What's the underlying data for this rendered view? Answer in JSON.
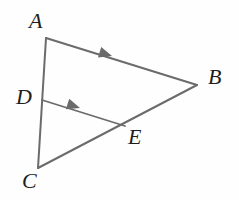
{
  "figure": {
    "background_color": "#fefefe",
    "stroke_color": "#6b6b6b",
    "label_color": "#1d1d1d",
    "stroke_width": 2,
    "width": 239,
    "height": 200,
    "points": {
      "A": {
        "x": 46,
        "y": 38
      },
      "B": {
        "x": 197,
        "y": 85
      },
      "C": {
        "x": 38,
        "y": 168
      },
      "D": {
        "x": 42,
        "y": 100
      },
      "E": {
        "x": 125,
        "y": 126
      }
    },
    "segments": [
      {
        "name": "AB",
        "from": "A",
        "to": "B",
        "tick_marks": 1
      },
      {
        "name": "AC",
        "from": "A",
        "to": "C",
        "tick_marks": 0
      },
      {
        "name": "CB",
        "from": "C",
        "to": "B",
        "tick_marks": 0
      },
      {
        "name": "DE",
        "from": "D",
        "to": "E",
        "tick_marks": 1
      }
    ],
    "parallel_arrows": [
      {
        "on_segment": "AB",
        "x": 112,
        "y": 56,
        "angle_deg": 17.3,
        "label": "single-arrow"
      },
      {
        "on_segment": "DE",
        "x": 80,
        "y": 108,
        "angle_deg": 17.4,
        "label": "single-arrow"
      }
    ],
    "labels": [
      {
        "id": "A",
        "text": "A",
        "x": 29,
        "y": 10
      },
      {
        "id": "B",
        "text": "B",
        "x": 208,
        "y": 66
      },
      {
        "id": "C",
        "text": "C",
        "x": 22,
        "y": 170
      },
      {
        "id": "D",
        "text": "D",
        "x": 16,
        "y": 86
      },
      {
        "id": "E",
        "text": "E",
        "x": 128,
        "y": 126
      }
    ]
  }
}
